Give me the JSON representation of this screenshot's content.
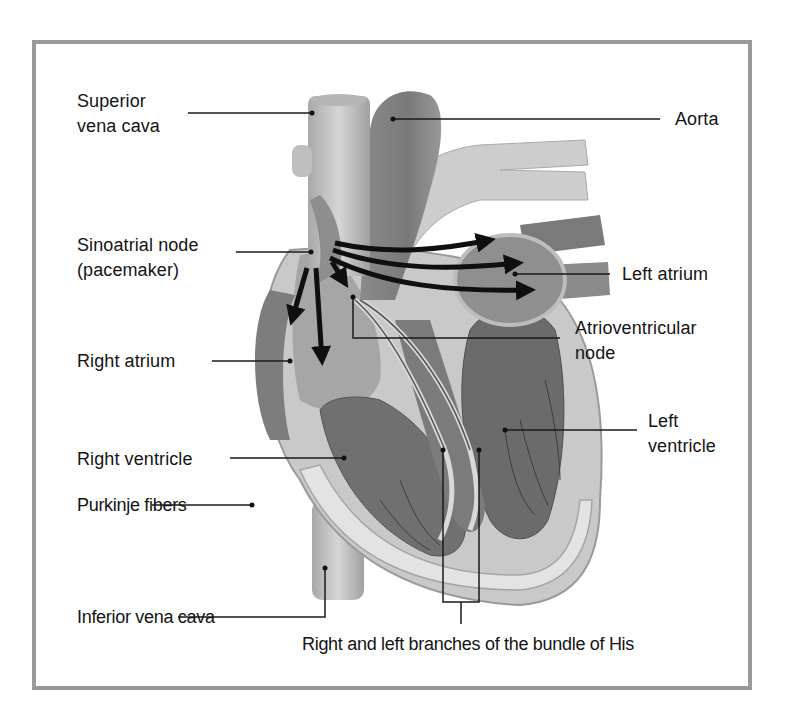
{
  "diagram": {
    "labels": {
      "superior_vena_cava": [
        "Superior",
        "vena cava"
      ],
      "aorta": "Aorta",
      "sinoatrial_node": [
        "Sinoatrial node",
        "(pacemaker)"
      ],
      "left_atrium": "Left atrium",
      "atrioventricular_node": [
        "Atrioventricular",
        "node"
      ],
      "right_atrium": "Right atrium",
      "left_ventricle": [
        "Left",
        "ventricle"
      ],
      "right_ventricle": "Right ventricle",
      "purkinje_fibers": "Purkinje fibers",
      "inferior_vena_cava": "Inferior vena cava",
      "bundle_of_his": "Right and left branches of the bundle of His"
    },
    "colors": {
      "frame": "#9a9a9a",
      "leader_line": "#1a1a1a",
      "arrow": "#0f0f0f",
      "tissue_dark": "#6e6e6e",
      "tissue_mid": "#9c9c9c",
      "tissue_light": "#cfcfcf",
      "vessel": "#bdbdbd"
    }
  }
}
